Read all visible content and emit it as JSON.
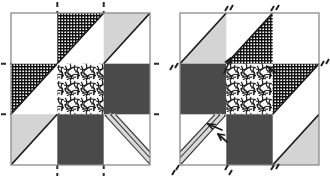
{
  "figure": {
    "type": "quilt-block-diagram",
    "panel_count": 2,
    "block_grid": "3x3",
    "colors": {
      "background": "#ffffff",
      "frame_line": "#8a8a8a",
      "dark_fill": "#4a4a4a",
      "light_fill": "#d4d4d4",
      "hatch_ink": "#1a1a1a",
      "seam_line": "#2b2b2b",
      "stripe_light": "#d9d9d9",
      "stripe_dark": "#3a3a3a",
      "arrow_ink": "#1c1c1c"
    },
    "fill_names": {
      "blank": "blank-white",
      "dark": "solid-dark-gray",
      "light": "light-gray",
      "hatch": "fine-crosshatch",
      "mottled": "mottled-speckle",
      "stripe": "diagonal-stripe-band"
    }
  },
  "panels": [
    {
      "id": "left",
      "name": "left-block",
      "guide_style": "dashed-extension-lines",
      "frame": {
        "x": 11,
        "y": 13,
        "w": 139,
        "h": 152
      },
      "cells": [
        {
          "r": 0,
          "c": 0,
          "fill": "blank",
          "shape": "square",
          "orient": "none"
        },
        {
          "r": 0,
          "c": 1,
          "fill": "hatch",
          "shape": "triangle",
          "orient": "upper-left"
        },
        {
          "r": 0,
          "c": 2,
          "fill": "light",
          "shape": "triangle",
          "orient": "upper-left"
        },
        {
          "r": 1,
          "c": 0,
          "fill": "hatch",
          "shape": "triangle",
          "orient": "upper-left"
        },
        {
          "r": 1,
          "c": 1,
          "fill": "mottled",
          "shape": "square",
          "orient": "none"
        },
        {
          "r": 1,
          "c": 2,
          "fill": "dark",
          "shape": "square",
          "orient": "none"
        },
        {
          "r": 2,
          "c": 0,
          "fill": "light",
          "shape": "triangle",
          "orient": "upper-left"
        },
        {
          "r": 2,
          "c": 1,
          "fill": "dark",
          "shape": "square",
          "orient": "none"
        },
        {
          "r": 2,
          "c": 2,
          "fill": "stripe",
          "shape": "band",
          "orient": "upper-left-to-lower-right"
        }
      ],
      "guides": [
        {
          "name": "vertical-seam-guide-left",
          "axis": "vertical",
          "at": 0.3333
        },
        {
          "name": "vertical-seam-guide-right",
          "axis": "vertical",
          "at": 0.6667
        },
        {
          "name": "horizontal-seam-guide-top",
          "axis": "horizontal",
          "at": 0.3333
        },
        {
          "name": "horizontal-seam-guide-bottom",
          "axis": "horizontal",
          "at": 0.6667
        }
      ],
      "arrows": []
    },
    {
      "id": "right",
      "name": "right-block",
      "guide_style": "short-diagonal-tick-marks",
      "frame": {
        "x": 180,
        "y": 13,
        "w": 139,
        "h": 152
      },
      "cells": [
        {
          "r": 0,
          "c": 0,
          "fill": "light",
          "shape": "triangle",
          "orient": "lower-right"
        },
        {
          "r": 0,
          "c": 1,
          "fill": "hatch",
          "shape": "triangle",
          "orient": "lower-right"
        },
        {
          "r": 0,
          "c": 2,
          "fill": "blank",
          "shape": "square",
          "orient": "none"
        },
        {
          "r": 1,
          "c": 0,
          "fill": "dark",
          "shape": "square",
          "orient": "none"
        },
        {
          "r": 1,
          "c": 1,
          "fill": "mottled",
          "shape": "square",
          "orient": "none"
        },
        {
          "r": 1,
          "c": 2,
          "fill": "hatch",
          "shape": "triangle",
          "orient": "upper-left"
        },
        {
          "r": 2,
          "c": 0,
          "fill": "stripe",
          "shape": "band",
          "orient": "upper-right-to-lower-left"
        },
        {
          "r": 2,
          "c": 1,
          "fill": "dark",
          "shape": "square",
          "orient": "none"
        },
        {
          "r": 2,
          "c": 2,
          "fill": "light",
          "shape": "triangle",
          "orient": "lower-right"
        }
      ],
      "tick_marks": [
        {
          "name": "tick-top-left",
          "x": 0.3333,
          "y": 0.0
        },
        {
          "name": "tick-top-right",
          "x": 0.6667,
          "y": 0.0
        },
        {
          "name": "tick-mid-left-edge",
          "x": 0.0,
          "y": 0.3333
        },
        {
          "name": "tick-mid-right-edge",
          "x": 1.0,
          "y": 0.3333
        },
        {
          "name": "tick-bottom-left",
          "x": 0.0,
          "y": 1.0
        },
        {
          "name": "tick-bottom-mid",
          "x": 0.3333,
          "y": 1.0
        },
        {
          "name": "tick-bottom-right",
          "x": 0.6667,
          "y": 1.0
        }
      ],
      "arrows": [
        {
          "name": "arrow-to-top-hatch-seam",
          "x1": 0.315,
          "y1": 0.395,
          "x2": 0.365,
          "y2": 0.3
        },
        {
          "name": "arrow-to-center-right-seam",
          "x1": 0.69,
          "y1": 0.395,
          "x2": 0.645,
          "y2": 0.355
        },
        {
          "name": "arrow-to-stripe-band-a",
          "x1": 0.3,
          "y1": 0.64,
          "x2": 0.205,
          "y2": 0.605
        },
        {
          "name": "arrow-to-stripe-band-b",
          "x1": 0.33,
          "y1": 0.7,
          "x2": 0.285,
          "y2": 0.655
        }
      ]
    }
  ]
}
